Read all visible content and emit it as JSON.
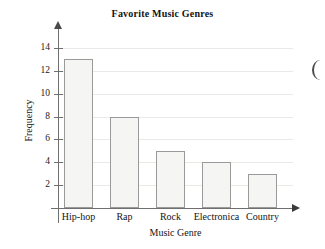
{
  "chart_data": {
    "type": "bar",
    "title": "Favorite Music Genres",
    "xlabel": "Music Genre",
    "ylabel": "Frequency",
    "categories": [
      "Hip-hop",
      "Rap",
      "Rock",
      "Electronica",
      "Country"
    ],
    "values": [
      13,
      8,
      5,
      4,
      3
    ],
    "ylim": [
      0,
      15
    ],
    "ytick_labels": [
      "2",
      "4",
      "6",
      "8",
      "10",
      "12",
      "14"
    ],
    "ytick_values": [
      2,
      4,
      6,
      8,
      10,
      12,
      14
    ],
    "grid": "horizontal",
    "legend": "none",
    "bar_fill_color": "#f5f5f3",
    "bar_border_color": "#9a9a9a",
    "axis_color": "#6f6f6f",
    "gridline_color": "#e9e9e6",
    "text_color": "#141414"
  }
}
